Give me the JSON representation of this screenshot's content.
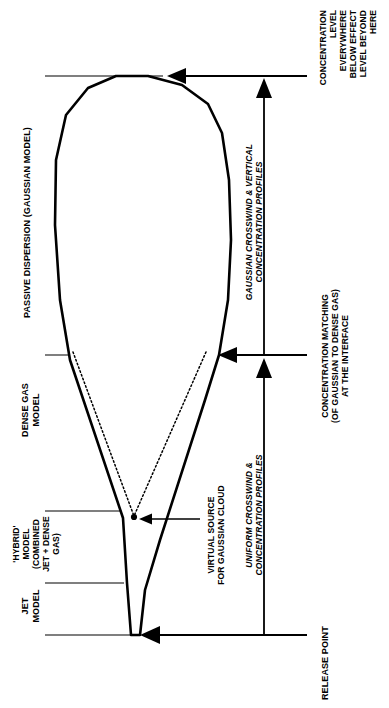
{
  "diagram": {
    "orientation": "text-rotated-90",
    "colors": {
      "ink": "#000000",
      "background": "#ffffff",
      "plume_outline": "#000000",
      "virtual_source_dotted": "#000000"
    },
    "zone_labels": [
      {
        "name": "passive-dispersion",
        "text": "PASSIVE DISPERSION (GAUSSIAN MODEL)",
        "align": "left"
      },
      {
        "name": "dense-gas-model",
        "text": "DENSE GAS\nMODEL",
        "align": "center"
      },
      {
        "name": "hybrid-model",
        "text": "'HYBRID'\nMODEL\n(COMBINED\nJET + DENSE\nGAS)",
        "align": "center"
      },
      {
        "name": "jet-model",
        "text": "JET\nMODEL",
        "align": "center"
      }
    ],
    "annotations": [
      {
        "name": "concentration-level-note",
        "text": "CONCENTRATION\nLEVEL\nEVERYWHERE\nBELOW EFFECT\nLEVEL BEYOND\nHERE",
        "style": "upright-bold",
        "align": "right"
      },
      {
        "name": "concentration-matching-note",
        "text": "CONCENTRATION MATCHING\n(OF GAUSSIAN TO DENSE GAS)\nAT THE INTERFACE",
        "style": "upright-bold",
        "align": "center"
      },
      {
        "name": "release-point-note",
        "text": "RELEASE POINT",
        "style": "upright-bold",
        "align": "left"
      },
      {
        "name": "virtual-source-note",
        "text": "VIRTUAL SOURCE\nFOR GAUSSIAN CLOUD",
        "style": "upright-bold",
        "align": "center"
      }
    ],
    "arrow_labels": [
      {
        "name": "gaussian-profiles-label",
        "text": "GAUSSIAN CROSSWIND & VERTICAL\nCONCENTRATION PROFILES",
        "style": "italic-bold"
      },
      {
        "name": "uniform-profiles-label",
        "text": "UNIFORM CROSSWIND &\nCONCENTRATION PROFILES",
        "style": "italic-bold"
      }
    ],
    "markers": {
      "virtual_source_point": "•"
    }
  }
}
